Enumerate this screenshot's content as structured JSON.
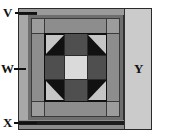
{
  "figure": {
    "type": "quilt-block-schematic",
    "width_px": 170,
    "height_px": 135
  },
  "labels": [
    {
      "id": "V",
      "text": "V",
      "side": "left",
      "refers_to": "outer-binding-strip-top"
    },
    {
      "id": "W",
      "text": "W",
      "side": "left",
      "refers_to": "outer-border-strip-left"
    },
    {
      "id": "X",
      "text": "X",
      "side": "left",
      "refers_to": "outer-binding-strip-bottom"
    },
    {
      "id": "Y",
      "text": "Y",
      "side": "right",
      "refers_to": "wide-border-panel-right"
    }
  ],
  "colors": {
    "background": "#ffffff",
    "outline": "#2a2a2a",
    "light_border_panel": "#cfcfcf",
    "medium_gray": "#8f8f8f",
    "medium_dark_gray": "#707070",
    "dark_gray": "#5a5a5a",
    "near_black": "#161616",
    "black": "#0b0b0b",
    "center_light": "#dcdcdc",
    "triangle_light": "#c8c8c8",
    "label_text": "#111111"
  },
  "block": {
    "name": "shoofly-churn-dash",
    "grid": "3x3",
    "center_patch": "light-square",
    "corner_patches": "half-square-triangles",
    "edge_patches": "dark-rectangles",
    "background": "black"
  },
  "borders": {
    "inner_sashing": "medium-gray",
    "corner_squares": "medium-gray",
    "outer_frame": "dark-gray",
    "right_panel": "light-gray",
    "binding_top": "dark",
    "binding_bottom": "dark"
  }
}
